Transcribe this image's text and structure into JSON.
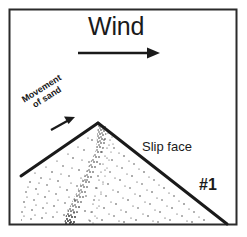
{
  "figure": {
    "id_label": "#1",
    "border_color": "#2b2b2b",
    "ink_color": "#1a1a1a",
    "background_color": "#ffffff",
    "stipple_color": "#333333"
  },
  "labels": {
    "wind": "Wind",
    "slip_face": "Slip face",
    "movement_line1": "Movement",
    "movement_line2": "of sand",
    "number": "#1"
  },
  "icons": {
    "wind_arrow": "arrow-right-icon",
    "sand_arrow": "arrow-up-right-icon",
    "dune_outline": "dune-profile-icon",
    "frame": "figure-border"
  },
  "geometry": {
    "frame": {
      "x": 9,
      "y": 9,
      "width": 228,
      "height": 216
    },
    "wind_arrow": {
      "x1": 78,
      "y1": 53,
      "x2": 158,
      "y2": 53
    },
    "sand_arrow": {
      "x1": 51,
      "y1": 130,
      "x2": 75,
      "y2": 118
    },
    "dune_crest": {
      "x": 98,
      "y": 123
    },
    "stoss_toe": {
      "x": 21,
      "y": 176
    },
    "slip_toe": {
      "x": 227,
      "y": 224
    }
  }
}
